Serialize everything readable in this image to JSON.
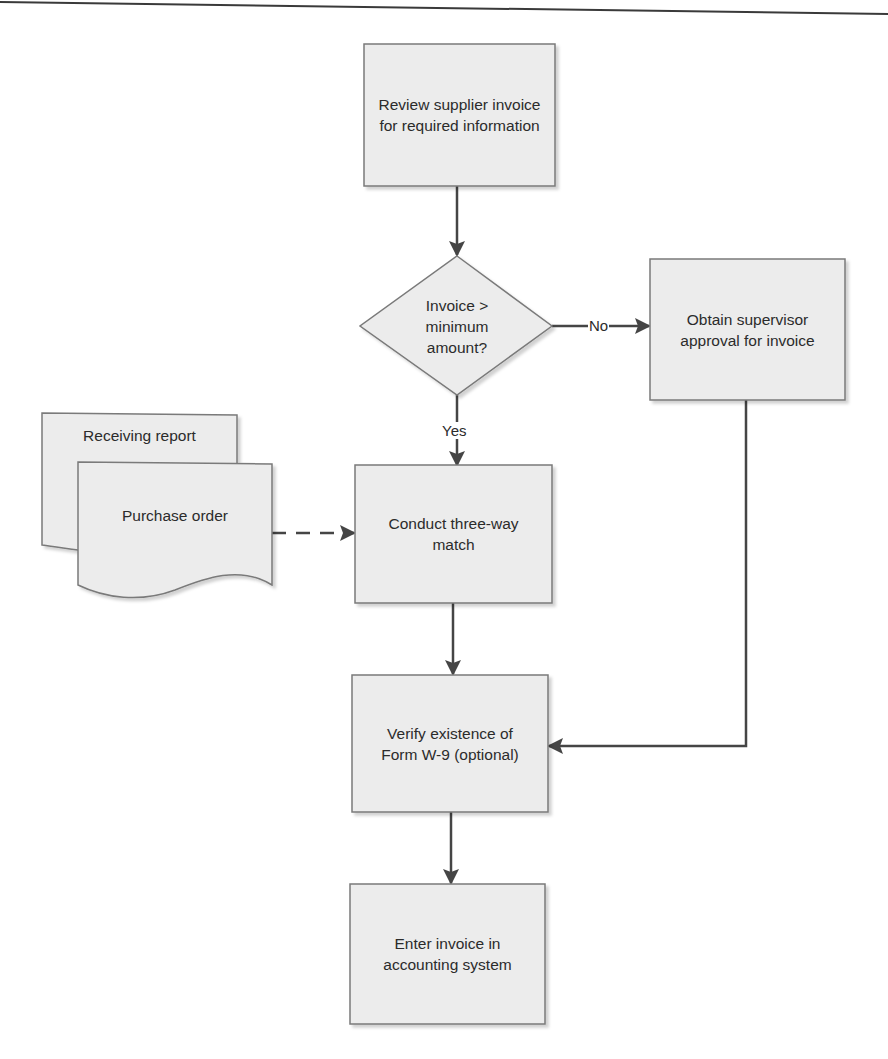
{
  "diagram": {
    "type": "flowchart",
    "colors": {
      "box_fill": "#ececec",
      "box_stroke": "#7a7a7a",
      "line": "#454545",
      "text": "#2b2b2b",
      "header_rule": "#3a3a3a"
    },
    "nodes": {
      "review": {
        "shape": "process",
        "label": "Review supplier invoice for required information"
      },
      "decision": {
        "shape": "decision",
        "label": "Invoice > minimum amount?"
      },
      "supervisor": {
        "shape": "process",
        "label": "Obtain supervisor approval for invoice"
      },
      "receiving_report": {
        "shape": "document",
        "label": "Receiving report"
      },
      "purchase_order": {
        "shape": "document",
        "label": "Purchase order"
      },
      "three_way": {
        "shape": "process",
        "label": "Conduct three-way match"
      },
      "verify_w9": {
        "shape": "process",
        "label": "Verify existence of Form W-9 (optional)"
      },
      "enter_invoice": {
        "shape": "process",
        "label": "Enter invoice in accounting system"
      }
    },
    "edges": [
      {
        "from": "review",
        "to": "decision",
        "label": ""
      },
      {
        "from": "decision",
        "to": "supervisor",
        "label": "No"
      },
      {
        "from": "decision",
        "to": "three_way",
        "label": "Yes"
      },
      {
        "from": "purchase_order",
        "to": "three_way",
        "label": "",
        "style": "dashed"
      },
      {
        "from": "three_way",
        "to": "verify_w9",
        "label": ""
      },
      {
        "from": "supervisor",
        "to": "verify_w9",
        "label": ""
      },
      {
        "from": "verify_w9",
        "to": "enter_invoice",
        "label": ""
      }
    ],
    "edge_labels": {
      "no": "No",
      "yes": "Yes"
    }
  }
}
